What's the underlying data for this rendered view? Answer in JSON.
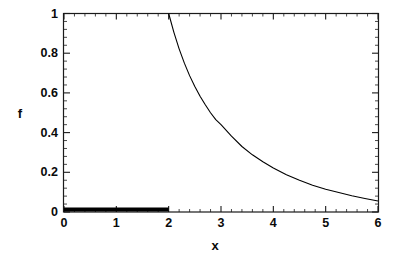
{
  "chart_data": {
    "type": "line",
    "title": "",
    "xlabel": "x",
    "ylabel": "f",
    "xlim": [
      0,
      6
    ],
    "ylim": [
      0,
      1
    ],
    "grid": false,
    "legend": null,
    "xticks": [
      {
        "value": 0,
        "label": "0"
      },
      {
        "value": 1,
        "label": "1"
      },
      {
        "value": 2,
        "label": "2"
      },
      {
        "value": 3,
        "label": "3"
      },
      {
        "value": 4,
        "label": "4"
      },
      {
        "value": 5,
        "label": "5"
      },
      {
        "value": 6,
        "label": "6"
      }
    ],
    "yticks": [
      {
        "value": 0,
        "label": "0"
      },
      {
        "value": 0.2,
        "label": "0.2"
      },
      {
        "value": 0.4,
        "label": "0.4"
      },
      {
        "value": 0.6,
        "label": "0.6"
      },
      {
        "value": 0.8,
        "label": "0.8"
      },
      {
        "value": 1,
        "label": "1"
      }
    ],
    "series": [
      {
        "name": "baseline-segment",
        "style": "thick-solid",
        "color": "#000000",
        "linewidth": 4,
        "x": [
          0,
          2
        ],
        "values": [
          0.012,
          0.012
        ]
      },
      {
        "name": "decay-curve",
        "style": "thin-solid",
        "color": "#000000",
        "linewidth": 1.1,
        "x": [
          2.0,
          2.1,
          2.2,
          2.3,
          2.4,
          2.5,
          2.6,
          2.7,
          2.8,
          2.9,
          3.0,
          3.2,
          3.4,
          3.6,
          3.8,
          4.0,
          4.25,
          4.5,
          4.75,
          5.0,
          5.25,
          5.5,
          5.75,
          6.0
        ],
        "values": [
          1.0,
          0.905,
          0.822,
          0.75,
          0.687,
          0.632,
          0.583,
          0.54,
          0.5,
          0.465,
          0.44,
          0.382,
          0.33,
          0.288,
          0.253,
          0.222,
          0.188,
          0.16,
          0.135,
          0.115,
          0.098,
          0.082,
          0.068,
          0.055
        ]
      }
    ]
  },
  "plot": {
    "frame_color": "#1a1a1a",
    "background": "#ffffff",
    "curve_color": "#000000"
  }
}
